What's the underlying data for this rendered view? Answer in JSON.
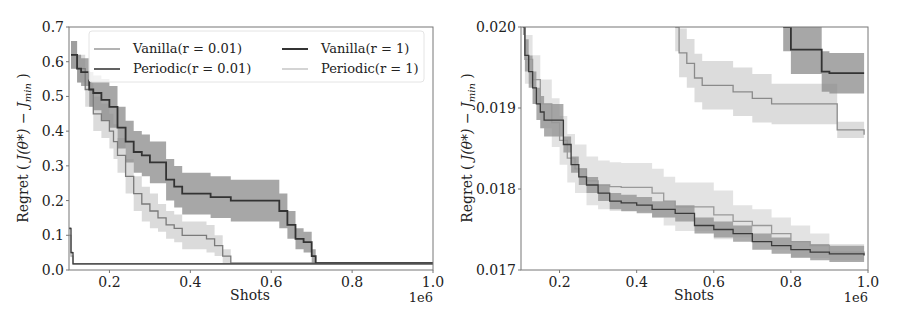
{
  "chart_data": [
    {
      "type": "line",
      "title": "",
      "xlabel": "Shots",
      "x_offset_label": "1e6",
      "ylabel": "Regret ( J(θ*) − J_min )",
      "xlim": [
        0.1,
        1.0
      ],
      "ylim": [
        0.0,
        0.7
      ],
      "xticks": [
        "0.2",
        "0.4",
        "0.6",
        "0.8",
        "1.0"
      ],
      "yticks": [
        "0.0",
        "0.1",
        "0.2",
        "0.3",
        "0.4",
        "0.5",
        "0.6",
        "0.7"
      ],
      "grid": false,
      "legend": {
        "position": "upper right",
        "columns": 2,
        "entries": [
          "Vanilla(r = 0.01)",
          "Vanilla(r = 1)",
          "Periodic(r = 0.01)",
          "Periodic(r = 1)"
        ]
      },
      "series": [
        {
          "name": "Vanilla(r = 1)",
          "color": "#333333",
          "band_color": "#8a8a8a",
          "x": [
            0.105,
            0.12,
            0.13,
            0.15,
            0.16,
            0.18,
            0.2,
            0.22,
            0.24,
            0.26,
            0.28,
            0.3,
            0.32,
            0.34,
            0.36,
            0.38,
            0.4,
            0.45,
            0.5,
            0.55,
            0.6,
            0.62,
            0.64,
            0.66,
            0.68,
            0.69,
            0.7,
            0.71,
            1.0
          ],
          "y": [
            0.62,
            0.58,
            0.57,
            0.52,
            0.51,
            0.49,
            0.47,
            0.41,
            0.37,
            0.34,
            0.33,
            0.31,
            0.31,
            0.26,
            0.24,
            0.22,
            0.22,
            0.21,
            0.2,
            0.2,
            0.2,
            0.17,
            0.13,
            0.09,
            0.08,
            0.08,
            0.04,
            0.02,
            0.02
          ],
          "band_halfwidth": [
            0.04,
            0.04,
            0.04,
            0.05,
            0.05,
            0.06,
            0.06,
            0.06,
            0.06,
            0.06,
            0.06,
            0.06,
            0.06,
            0.06,
            0.06,
            0.06,
            0.06,
            0.06,
            0.06,
            0.06,
            0.06,
            0.05,
            0.04,
            0.03,
            0.03,
            0.03,
            0.02,
            0.003,
            0.003
          ]
        },
        {
          "name": "Vanilla(r = 0.01)",
          "color": "#7a7a7a",
          "band_color": "#cfcfcf",
          "x": [
            0.105,
            0.12,
            0.14,
            0.16,
            0.18,
            0.2,
            0.21,
            0.22,
            0.24,
            0.26,
            0.28,
            0.3,
            0.32,
            0.34,
            0.36,
            0.38,
            0.4,
            0.42,
            0.44,
            0.46,
            0.48,
            0.5,
            1.0
          ],
          "y": [
            0.62,
            0.58,
            0.52,
            0.45,
            0.43,
            0.4,
            0.37,
            0.33,
            0.27,
            0.22,
            0.19,
            0.17,
            0.15,
            0.13,
            0.12,
            0.1,
            0.1,
            0.1,
            0.09,
            0.07,
            0.04,
            0.02,
            0.02
          ],
          "band_halfwidth": [
            0.04,
            0.04,
            0.05,
            0.05,
            0.05,
            0.05,
            0.05,
            0.05,
            0.05,
            0.05,
            0.05,
            0.05,
            0.04,
            0.04,
            0.04,
            0.04,
            0.04,
            0.04,
            0.04,
            0.03,
            0.02,
            0.003,
            0.003
          ]
        },
        {
          "name": "Periodic(r = 0.01)",
          "color": "#3a3a3a",
          "band_color": "#9a9a9a",
          "x": [
            0.1,
            0.105,
            0.11,
            1.0
          ],
          "y": [
            0.12,
            0.05,
            0.018,
            0.018
          ],
          "band_halfwidth": [
            0.003,
            0.003,
            0.002,
            0.002
          ]
        },
        {
          "name": "Periodic(r = 1)",
          "color": "#b0b0b0",
          "band_color": "#e0e0e0",
          "x": [
            0.1,
            0.105,
            0.11,
            1.0
          ],
          "y": [
            0.1,
            0.04,
            0.018,
            0.018
          ],
          "band_halfwidth": [
            0.003,
            0.003,
            0.002,
            0.002
          ]
        }
      ]
    },
    {
      "type": "line",
      "title": "",
      "xlabel": "Shots",
      "x_offset_label": "1e6",
      "ylabel": "Regret ( J(θ*) − J_min )",
      "xlim": [
        0.1,
        1.0
      ],
      "ylim": [
        0.017,
        0.02
      ],
      "xticks": [
        "0.2",
        "0.4",
        "0.6",
        "0.8",
        "1.0"
      ],
      "yticks": [
        "0.017",
        "0.018",
        "0.019",
        "0.020"
      ],
      "grid": false,
      "series": [
        {
          "name": "Vanilla(r = 1)",
          "color": "#333333",
          "band_color": "#8a8a8a",
          "x": [
            0.78,
            0.8,
            0.8,
            0.88,
            0.88,
            0.9,
            0.9,
            0.99
          ],
          "y": [
            0.02,
            0.02,
            0.01972,
            0.01972,
            0.01945,
            0.01945,
            0.01943,
            0.01943
          ],
          "band_halfwidth": [
            0.0003,
            0.0003,
            0.0003,
            0.0003,
            0.00025,
            0.00025,
            0.00025,
            0.00025
          ]
        },
        {
          "name": "Vanilla(r = 0.01)",
          "color": "#8a8a8a",
          "band_color": "#d0d0d0",
          "x": [
            0.5,
            0.51,
            0.53,
            0.55,
            0.57,
            0.62,
            0.65,
            0.7,
            0.75,
            0.8,
            0.9,
            0.92,
            0.99
          ],
          "y": [
            0.02,
            0.01968,
            0.01955,
            0.01937,
            0.01928,
            0.01928,
            0.0192,
            0.01912,
            0.01905,
            0.01905,
            0.01905,
            0.01873,
            0.01867
          ],
          "band_halfwidth": [
            0.0003,
            0.0003,
            0.0003,
            0.0003,
            0.0003,
            0.0003,
            0.0003,
            0.0003,
            0.00025,
            0.00025,
            0.00025,
            0.0001,
            0.0001
          ]
        },
        {
          "name": "Periodic(r = 0.01)",
          "color": "#3a3a3a",
          "band_color": "#8f8f8f",
          "x": [
            0.105,
            0.11,
            0.12,
            0.13,
            0.14,
            0.15,
            0.16,
            0.2,
            0.21,
            0.23,
            0.25,
            0.27,
            0.3,
            0.33,
            0.36,
            0.4,
            0.44,
            0.5,
            0.55,
            0.6,
            0.65,
            0.7,
            0.75,
            0.8,
            0.85,
            0.9,
            0.99
          ],
          "y": [
            0.02,
            0.01965,
            0.01945,
            0.01925,
            0.01905,
            0.01895,
            0.01885,
            0.01885,
            0.01855,
            0.0183,
            0.01815,
            0.01805,
            0.01795,
            0.01785,
            0.01783,
            0.0178,
            0.01775,
            0.0177,
            0.01755,
            0.0175,
            0.01745,
            0.01735,
            0.0173,
            0.01725,
            0.01722,
            0.0172,
            0.01718
          ],
          "band_halfwidth": [
            0.0001,
            0.0002,
            0.0002,
            0.0002,
            0.0002,
            0.0002,
            0.0002,
            0.0002,
            0.0001,
            0.0001,
            0.0001,
            0.0001,
            0.0001,
            0.0001,
            0.0001,
            0.0001,
            0.0001,
            0.0001,
            0.0001,
            0.0001,
            0.0001,
            0.0001,
            0.0001,
            0.0001,
            0.0001,
            0.0001,
            0.0001
          ]
        },
        {
          "name": "Periodic(r = 1)",
          "color": "#999999",
          "band_color": "#d9d9d9",
          "x": [
            0.105,
            0.11,
            0.13,
            0.15,
            0.18,
            0.2,
            0.22,
            0.24,
            0.27,
            0.3,
            0.33,
            0.36,
            0.4,
            0.44,
            0.47,
            0.5,
            0.55,
            0.6,
            0.65,
            0.7,
            0.75,
            0.8,
            0.85,
            0.9,
            0.99
          ],
          "y": [
            0.02,
            0.0196,
            0.01935,
            0.01905,
            0.01882,
            0.0186,
            0.01838,
            0.01825,
            0.0181,
            0.01805,
            0.01803,
            0.01802,
            0.01802,
            0.01795,
            0.01785,
            0.01778,
            0.01778,
            0.01768,
            0.0176,
            0.01755,
            0.01745,
            0.01735,
            0.0173,
            0.01722,
            0.0172
          ],
          "band_halfwidth": [
            0.0001,
            0.0003,
            0.0003,
            0.0003,
            0.0003,
            0.0003,
            0.0003,
            0.0003,
            0.0003,
            0.0003,
            0.0003,
            0.0003,
            0.0003,
            0.0003,
            0.0003,
            0.0003,
            0.0003,
            0.0003,
            0.0002,
            0.0002,
            0.0002,
            0.0002,
            0.00015,
            0.0001,
            0.0001
          ]
        }
      ]
    }
  ],
  "panels": [
    {
      "ylabel_text": "Regret (",
      "ylabel_math": "J(θ*) − J",
      "ylabel_sub": "min",
      "ylabel_close": " )",
      "xlabel": "Shots",
      "offset": "1e6"
    },
    {
      "ylabel_text": "Regret (",
      "ylabel_math": "J(θ*) − J",
      "ylabel_sub": "min",
      "ylabel_close": " )",
      "xlabel": "Shots",
      "offset": "1e6"
    }
  ],
  "legend": {
    "items": [
      {
        "label": "Vanilla(r = 0.01)",
        "color": "#8a8a8a",
        "width": 1.3
      },
      {
        "label": "Vanilla(r = 1)",
        "color": "#333333",
        "width": 2
      },
      {
        "label": "Periodic(r = 0.01)",
        "color": "#3a3a3a",
        "width": 1.6
      },
      {
        "label": "Periodic(r = 1)",
        "color": "#bdbdbd",
        "width": 1.3
      }
    ]
  }
}
